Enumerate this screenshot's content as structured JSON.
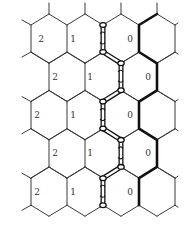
{
  "diagram": {
    "type": "hexagonal-lattice",
    "grid": {
      "rows": 5,
      "hex_width": 36,
      "row_pitch": 38.3,
      "side_length": 27,
      "slant_height": 11,
      "first_row_side_top": 25,
      "even_row_left_x": [
        31,
        67,
        103,
        139,
        175
      ],
      "odd_row_left_x": [
        49,
        85,
        121,
        157
      ],
      "left_stub_x": 22,
      "right_stub_x": 178
    },
    "labels": [
      {
        "row": 0,
        "items": [
          {
            "text": "2",
            "x": 41
          },
          {
            "text": "1",
            "x": 73
          },
          {
            "text": "0",
            "x": 130
          }
        ]
      },
      {
        "row": 1,
        "items": [
          {
            "text": "2",
            "x": 55
          },
          {
            "text": "1",
            "x": 90
          },
          {
            "text": "0",
            "x": 148
          }
        ]
      },
      {
        "row": 2,
        "items": [
          {
            "text": "2",
            "x": 37
          },
          {
            "text": "1",
            "x": 73
          },
          {
            "text": "0",
            "x": 130
          }
        ]
      },
      {
        "row": 3,
        "items": [
          {
            "text": "2",
            "x": 55
          },
          {
            "text": "1",
            "x": 90
          },
          {
            "text": "0",
            "x": 148
          }
        ]
      },
      {
        "row": 4,
        "items": [
          {
            "text": "2",
            "x": 37
          },
          {
            "text": "1",
            "x": 73
          },
          {
            "text": "0",
            "x": 130
          }
        ]
      }
    ],
    "thick_boundary": {
      "even_row_x": 139,
      "odd_row_x": 157,
      "color": "#111111"
    },
    "chain": {
      "even_row_x": 103,
      "odd_row_x": 121,
      "color": "#111111"
    },
    "colors": {
      "background": "#ffffff",
      "line": "#3a3a3a",
      "label": "#333333"
    }
  }
}
